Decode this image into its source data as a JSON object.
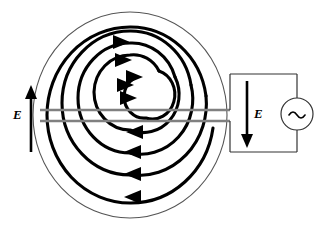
{
  "figure": {
    "type": "physics-circuit-diagram",
    "width": 327,
    "height": 232,
    "background_color": "#ffffff"
  },
  "labels": {
    "field_left": {
      "text": "E",
      "meaning": "induced-electric-field",
      "arrow_direction": "up",
      "x": 13,
      "y": 108
    },
    "field_right": {
      "text": "E",
      "meaning": "induced-electric-field",
      "arrow_direction": "down",
      "x": 254,
      "y": 107
    }
  },
  "source": {
    "symbol": "~",
    "kind": "ac-voltage-source",
    "center_x": 297,
    "center_y": 114,
    "radius": 16
  },
  "colors": {
    "stroke": "#000000",
    "lead_gray": "#808080",
    "outline_thin": "#555555",
    "background": "#ffffff"
  },
  "geometry": {
    "center_x": 130,
    "center_y": 115,
    "outer_circle_rx": 97,
    "outer_circle_ry": 103,
    "spiral_turns": 4,
    "spiral_rotation": "clockwise",
    "arrowheads_top_direction": "right",
    "arrowheads_bottom_direction": "left",
    "lead_line_top_y": 110,
    "lead_line_bottom_y": 121,
    "lead_line_left_x": 40,
    "lead_line_right_x": 230,
    "circuit_top_wire_y": 74,
    "circuit_bottom_wire_y": 152,
    "circuit_left_x": 230,
    "circuit_right_x": 297
  },
  "annotations": {
    "spiral_description": "Four-turn bold clockwise spiral coil terminating at the center",
    "outer_ring_description": "Thin circular boundary enclosing the spiral",
    "leads_description": "Two horizontal gray leads forming a narrow channel through the coil to the external circuit"
  }
}
